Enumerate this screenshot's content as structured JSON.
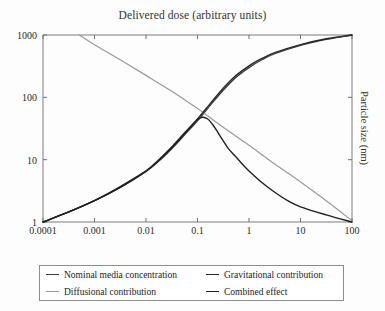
{
  "chart_data": {
    "type": "line",
    "title": "Delivered dose (arbitrary units)",
    "xlabel": "",
    "ylabel": "Particle size (nm)",
    "ylabel_position": "right",
    "xscale": "log",
    "yscale": "log",
    "xlim": [
      0.0001,
      100
    ],
    "ylim": [
      1,
      1000
    ],
    "grid": false,
    "legend_position": "below",
    "xticks": [
      "0.0001",
      "0.001",
      "0.01",
      "0.1",
      "1",
      "10",
      "100"
    ],
    "xtick_values": [
      0.0001,
      0.001,
      0.01,
      0.1,
      1,
      10,
      100
    ],
    "yticks": [
      "1",
      "10",
      "100",
      "1000"
    ],
    "ytick_values": [
      1,
      10,
      100,
      1000
    ],
    "series": [
      {
        "name": "Nominal media concentration",
        "color": "#3a3a3a",
        "width": 1.3,
        "points": [
          [
            0.0001,
            1.0
          ],
          [
            0.000316,
            1.45
          ],
          [
            0.001,
            2.2
          ],
          [
            0.00316,
            3.6
          ],
          [
            0.01,
            6.5
          ],
          [
            0.0178,
            9.5
          ],
          [
            0.0316,
            15.0
          ],
          [
            0.0562,
            25.0
          ],
          [
            0.1,
            42.0
          ],
          [
            0.178,
            75.0
          ],
          [
            0.316,
            130.0
          ],
          [
            0.562,
            210.0
          ],
          [
            1.0,
            300.0
          ],
          [
            1.78,
            400.0
          ],
          [
            3.16,
            500.0
          ],
          [
            10.0,
            680.0
          ],
          [
            31.6,
            850.0
          ],
          [
            100.0,
            1000.0
          ]
        ]
      },
      {
        "name": "Diffusional contribution",
        "color": "#9a9a9a",
        "width": 1.2,
        "points": [
          [
            0.00051,
            1000.0
          ],
          [
            0.001,
            700.0
          ],
          [
            0.00316,
            400.0
          ],
          [
            0.01,
            225.0
          ],
          [
            0.0316,
            125.0
          ],
          [
            0.1,
            66.0
          ],
          [
            0.316,
            33.0
          ],
          [
            1.0,
            17.0
          ],
          [
            3.16,
            8.5
          ],
          [
            10.0,
            4.4
          ],
          [
            31.6,
            2.2
          ],
          [
            100.0,
            1.05
          ]
        ]
      },
      {
        "name": "Gravitational contribution",
        "color": "#2a2a2a",
        "width": 1.4,
        "points": [
          [
            0.0001,
            1.0
          ],
          [
            0.000316,
            1.45
          ],
          [
            0.001,
            2.2
          ],
          [
            0.00316,
            3.7
          ],
          [
            0.01,
            6.6
          ],
          [
            0.0178,
            10.0
          ],
          [
            0.0316,
            16.0
          ],
          [
            0.0562,
            27.0
          ],
          [
            0.1,
            45.0
          ],
          [
            0.178,
            80.0
          ],
          [
            0.316,
            140.0
          ],
          [
            0.562,
            225.0
          ],
          [
            1.0,
            320.0
          ],
          [
            1.78,
            420.0
          ],
          [
            3.16,
            520.0
          ],
          [
            10.0,
            700.0
          ],
          [
            31.6,
            870.0
          ],
          [
            100.0,
            1000.0
          ]
        ]
      },
      {
        "name": "Combined effect",
        "color": "#1f1f1f",
        "width": 1.4,
        "points": [
          [
            0.0001,
            1.0
          ],
          [
            0.000316,
            1.45
          ],
          [
            0.001,
            2.2
          ],
          [
            0.00316,
            3.6
          ],
          [
            0.01,
            6.5
          ],
          [
            0.0178,
            9.8
          ],
          [
            0.0316,
            15.5
          ],
          [
            0.0562,
            26.0
          ],
          [
            0.0794,
            36.0
          ],
          [
            0.1,
            44.0
          ],
          [
            0.126,
            48.0
          ],
          [
            0.158,
            45.0
          ],
          [
            0.2,
            36.0
          ],
          [
            0.251,
            27.0
          ],
          [
            0.316,
            20.0
          ],
          [
            0.398,
            15.0
          ],
          [
            0.562,
            11.0
          ],
          [
            0.794,
            8.0
          ],
          [
            1.0,
            6.6
          ],
          [
            1.78,
            4.3
          ],
          [
            3.16,
            3.0
          ],
          [
            5.62,
            2.2
          ],
          [
            10.0,
            1.75
          ],
          [
            31.6,
            1.3
          ],
          [
            100.0,
            1.0
          ]
        ]
      }
    ]
  },
  "legend": {
    "items": [
      {
        "label": "Nominal media concentration",
        "color": "#3a3a3a"
      },
      {
        "label": "Gravitational contribution",
        "color": "#2a2a2a"
      },
      {
        "label": "Diffusional contribution",
        "color": "#9a9a9a"
      },
      {
        "label": "Combined effect",
        "color": "#1f1f1f"
      }
    ]
  }
}
